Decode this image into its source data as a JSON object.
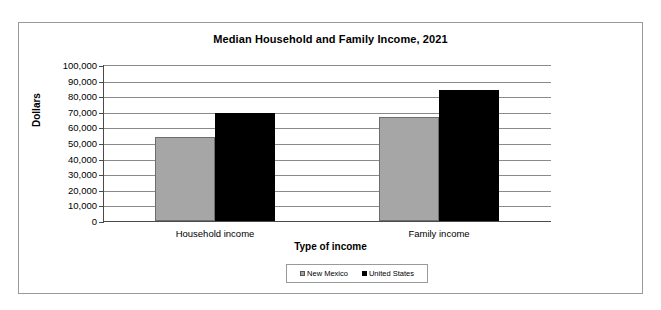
{
  "chart_data": {
    "type": "bar",
    "title": "Median Household and Family Income, 2021",
    "xlabel": "Type of income",
    "ylabel": "Dollars",
    "categories": [
      "Household income",
      "Family income"
    ],
    "series": [
      {
        "name": "New Mexico",
        "color": "#a6a6a6",
        "values": [
          54000,
          66500
        ]
      },
      {
        "name": "United States",
        "color": "#000000",
        "values": [
          69000,
          84000
        ]
      }
    ],
    "ylim": [
      0,
      100000
    ],
    "ytick_step": 10000,
    "ytick_labels": [
      "100,000",
      "90,000",
      "80,000",
      "70,000",
      "60,000",
      "50,000",
      "40,000",
      "30,000",
      "20,000",
      "10,000",
      "0"
    ],
    "ytick_values": [
      100000,
      90000,
      80000,
      70000,
      60000,
      50000,
      40000,
      30000,
      20000,
      10000,
      0
    ],
    "grid": true,
    "legend_position": "bottom",
    "legend_entries": [
      "New Mexico",
      "United States"
    ]
  }
}
